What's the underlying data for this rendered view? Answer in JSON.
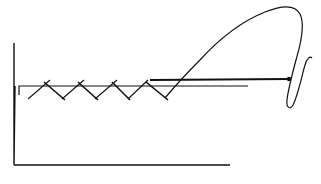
{
  "diagram": {
    "width": 321,
    "height": 184,
    "background": "#ffffff",
    "stroke_color": "#111111",
    "axes": {
      "vertical": {
        "points": "14,43 14,165 15,86"
      },
      "horizontal": {
        "points": "14,165 230,165"
      }
    },
    "platform_line": {
      "points": "19,95 19,86 248,86"
    },
    "upper_rail": {
      "points": "150,80 290,79"
    },
    "crosses": [
      {
        "a": "28,99 50,80",
        "b": "44,82 65,100"
      },
      {
        "a": "62,99 84,80",
        "b": "78,82 98,100"
      },
      {
        "a": "95,99 117,80",
        "b": "112,82 130,100"
      },
      {
        "a": "128,99 148,80",
        "b": "146,82 168,100"
      }
    ],
    "curve": {
      "path": "M165,98 C175,86 185,75 200,60 C220,38 240,22 265,12 C280,6 295,4 300,14 C305,24 302,40 296,60 C292,75 288,90 287,100 C286,108 290,110 293,105 C298,95 302,75 305,65 C307,58 310,56 312,58"
    },
    "rail_endpoint": {
      "cx": 289,
      "cy": 79,
      "r": 2.2
    }
  }
}
